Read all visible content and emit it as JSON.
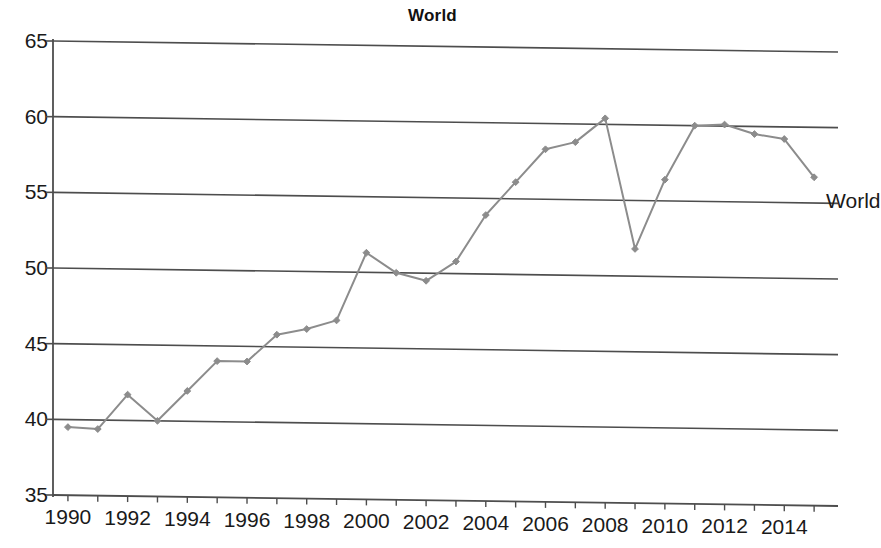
{
  "chart_data": {
    "type": "line",
    "title": "World",
    "xlabel": "",
    "ylabel": "",
    "xlim": [
      1989.5,
      2015.8
    ],
    "ylim": [
      35,
      65
    ],
    "grid": true,
    "grid_axis": "y",
    "legend_position": "inline-right",
    "series": [
      {
        "name": "World",
        "color": "#8c8c8c",
        "marker": "diamond",
        "x": [
          1990,
          1991,
          1992,
          1993,
          1994,
          1995,
          1996,
          1997,
          1998,
          1999,
          2000,
          2001,
          2002,
          2003,
          2004,
          2005,
          2006,
          2007,
          2008,
          2009,
          2010,
          2011,
          2012,
          2013,
          2014,
          2015
        ],
        "values": [
          39.5,
          39.4,
          41.7,
          40.0,
          42.0,
          44.0,
          44.0,
          45.8,
          46.2,
          46.8,
          51.3,
          50.0,
          49.5,
          50.8,
          53.9,
          56.1,
          58.3,
          58.8,
          60.4,
          51.8,
          56.4,
          60.0,
          60.1,
          59.5,
          59.2,
          56.7
        ]
      }
    ],
    "x_tick_values": [
      1990,
      1991,
      1992,
      1993,
      1994,
      1995,
      1996,
      1997,
      1998,
      1999,
      2000,
      2001,
      2002,
      2003,
      2004,
      2005,
      2006,
      2007,
      2008,
      2009,
      2010,
      2011,
      2012,
      2013,
      2014,
      2015
    ],
    "x_tick_labels": [
      "1990",
      "1992",
      "1994",
      "1996",
      "1998",
      "2000",
      "2002",
      "2004",
      "2006",
      "2008",
      "2010",
      "2012",
      "2014"
    ],
    "x_tick_label_values": [
      1990,
      1992,
      1994,
      1996,
      1998,
      2000,
      2002,
      2004,
      2006,
      2008,
      2010,
      2012,
      2014
    ],
    "y_tick_labels": [
      "35",
      "40",
      "45",
      "50",
      "55",
      "60",
      "65"
    ],
    "y_tick_values": [
      35,
      40,
      45,
      50,
      55,
      60,
      65
    ],
    "annotations": [
      {
        "text": "World",
        "x": 2015.4,
        "y": 55.0
      }
    ]
  },
  "colors": {
    "series": "#8c8c8c",
    "grid": "#4d4d4d",
    "axis": "#4d4d4d",
    "text": "#1a1a1a",
    "background": "#ffffff"
  },
  "series_label": {
    "world": "World"
  }
}
